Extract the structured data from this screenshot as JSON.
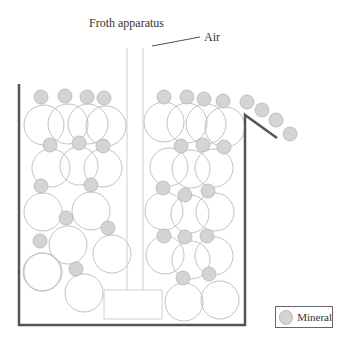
{
  "labels": {
    "title": "Froth apparatus",
    "air": "Air"
  },
  "legend": {
    "items": [
      {
        "label": "Mineral",
        "color": "#d4d4d4"
      }
    ]
  },
  "colors": {
    "wall": "#555555",
    "bubble_stroke": "#bbbbbb",
    "mineral_fill": "#d4d4d4",
    "mineral_stroke": "#b5b5b5"
  },
  "diagram": {
    "bubbles": [
      [
        44,
        125,
        20
      ],
      [
        68,
        124,
        20
      ],
      [
        88,
        124,
        20
      ],
      [
        106,
        126,
        20
      ],
      [
        51,
        168,
        19
      ],
      [
        79,
        166,
        19
      ],
      [
        103,
        168,
        19
      ],
      [
        43,
        212,
        19
      ],
      [
        91,
        211,
        19
      ],
      [
        42,
        272,
        19
      ],
      [
        68,
        245,
        19
      ],
      [
        112,
        254,
        19
      ],
      [
        43,
        272,
        19
      ],
      [
        84,
        293,
        19
      ],
      [
        164,
        122,
        20
      ],
      [
        187,
        123,
        20
      ],
      [
        206,
        124,
        20
      ],
      [
        225,
        127,
        20
      ],
      [
        169,
        167,
        19
      ],
      [
        191,
        169,
        19
      ],
      [
        214,
        168,
        19
      ],
      [
        164,
        211,
        19
      ],
      [
        190,
        214,
        19
      ],
      [
        215,
        212,
        19
      ],
      [
        165,
        255,
        19
      ],
      [
        191,
        260,
        19
      ],
      [
        214,
        256,
        19
      ],
      [
        184,
        302,
        19
      ],
      [
        220,
        300,
        19
      ]
    ],
    "minerals": [
      [
        41,
        97
      ],
      [
        65,
        96
      ],
      [
        87,
        97
      ],
      [
        104,
        98
      ],
      [
        50,
        145
      ],
      [
        79,
        143
      ],
      [
        103,
        146
      ],
      [
        41,
        186
      ],
      [
        91,
        185
      ],
      [
        40,
        241
      ],
      [
        66,
        218
      ],
      [
        108,
        228
      ],
      [
        76,
        269
      ],
      [
        164,
        97
      ],
      [
        187,
        97
      ],
      [
        204,
        99
      ],
      [
        223,
        101
      ],
      [
        181,
        146
      ],
      [
        203,
        145
      ],
      [
        224,
        147
      ],
      [
        163,
        188
      ],
      [
        185,
        195
      ],
      [
        208,
        191
      ],
      [
        164,
        236
      ],
      [
        185,
        237
      ],
      [
        207,
        236
      ],
      [
        183,
        278
      ],
      [
        209,
        274
      ],
      [
        247,
        102
      ],
      [
        262,
        110
      ],
      [
        276,
        120
      ],
      [
        290,
        134
      ]
    ]
  }
}
